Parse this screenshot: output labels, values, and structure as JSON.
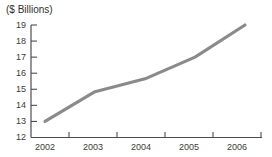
{
  "chart_data": {
    "type": "line",
    "title": "",
    "ylabel": "($ Billions)",
    "xlabel": "",
    "categories": [
      "2002",
      "2003",
      "2004",
      "2005",
      "2006"
    ],
    "x": [
      2002,
      2003,
      2004,
      2005,
      2006
    ],
    "values": [
      13.0,
      14.85,
      15.65,
      17.0,
      19.0
    ],
    "series": [
      {
        "name": "",
        "values": [
          13.0,
          14.85,
          15.65,
          17.0,
          19.0
        ]
      }
    ],
    "ylim": [
      12,
      19
    ],
    "yticks": [
      12,
      13,
      14,
      15,
      16,
      17,
      18,
      19
    ],
    "ytick_labels": [
      "12",
      "13",
      "14",
      "15",
      "16",
      "17",
      "18",
      "19"
    ],
    "xtick_labels": [
      "2002",
      "2003",
      "2004",
      "2005",
      "2006"
    ],
    "grid": false,
    "legend": false,
    "legend_position": "none",
    "line_color": "#8a8a8a",
    "axis_color": "#4d4d4d",
    "background_color": "#ffffff"
  }
}
